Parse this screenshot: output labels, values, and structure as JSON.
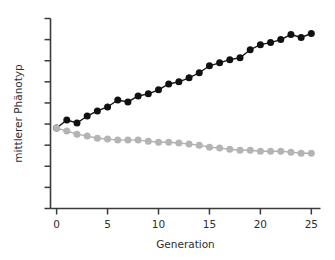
{
  "chart_data": {
    "type": "line",
    "title": "",
    "subtitle": "",
    "xlabel": "Generation",
    "ylabel": "mittlerer Phänotyp",
    "xlim": [
      -0.6,
      25.9
    ],
    "ylim": [
      0,
      9
    ],
    "grid": false,
    "legend": null,
    "legend_position": "none",
    "x_ticks": [
      0,
      5,
      10,
      15,
      20,
      25
    ],
    "x_tick_labels": [
      "0",
      "5",
      "10",
      "15",
      "20",
      "25"
    ],
    "y_ticks": [
      0,
      1,
      2,
      3,
      4,
      5,
      6,
      7,
      8,
      9
    ],
    "y_tick_labels": [
      "",
      "",
      "",
      "",
      "",
      "",
      "",
      "",
      "",
      ""
    ],
    "y_axis_labeled": false,
    "marker": "filled-circle",
    "x": [
      0,
      1,
      2,
      3,
      4,
      5,
      6,
      7,
      8,
      9,
      10,
      11,
      12,
      13,
      14,
      15,
      16,
      17,
      18,
      19,
      20,
      21,
      22,
      23,
      24,
      25
    ],
    "series": [
      {
        "name": "aufwaerts-selektierte-linie",
        "color": "#111111",
        "values": [
          3.81,
          4.19,
          4.05,
          4.38,
          4.62,
          4.81,
          5.14,
          5.05,
          5.33,
          5.43,
          5.62,
          5.9,
          6.0,
          6.19,
          6.43,
          6.76,
          6.9,
          7.05,
          7.14,
          7.52,
          7.76,
          7.86,
          8.0,
          8.24,
          8.1,
          8.29
        ]
      },
      {
        "name": "abwaerts-selektierte-linie",
        "color": "#b4b4b4",
        "values": [
          3.81,
          3.67,
          3.52,
          3.43,
          3.33,
          3.29,
          3.24,
          3.24,
          3.24,
          3.19,
          3.14,
          3.14,
          3.1,
          3.05,
          3.0,
          2.9,
          2.86,
          2.81,
          2.76,
          2.76,
          2.71,
          2.71,
          2.71,
          2.67,
          2.62,
          2.62
        ]
      }
    ]
  },
  "axes": {
    "x_axis_name": "x-axis",
    "y_axis_name": "y-axis"
  }
}
